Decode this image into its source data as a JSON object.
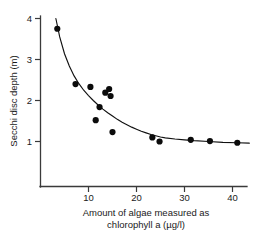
{
  "chart_data": {
    "type": "scatter",
    "title": "",
    "subtitle": "",
    "xlabel": "Amount of algae measured as chlorophyll a (µg/l)",
    "xlabel_line1": "Amount of algae measured as",
    "xlabel_line2": "chlorophyll a (µg/l)",
    "ylabel": "Secchi disc depth (m)",
    "xlim": [
      0,
      44
    ],
    "ylim": [
      0,
      4.2
    ],
    "xticks": [
      10,
      20,
      30,
      40
    ],
    "xtick_labels": [
      "10",
      "20",
      "30",
      "40"
    ],
    "yticks": [
      1,
      2,
      3,
      4
    ],
    "ytick_labels": [
      "1",
      "2",
      "3",
      "4"
    ],
    "grid": false,
    "legend": false,
    "legend_position": "none",
    "marker": "filled-circle",
    "marker_color": "#0b0b0b",
    "curve_color": "#111111",
    "axis_color": "#3a3a3a",
    "background_color": "#ffffff",
    "x": [
      3.5,
      7.3,
      10.4,
      11.5,
      12.3,
      13.5,
      14.3,
      14.6,
      15.0,
      23.3,
      24.8,
      31.3,
      35.3,
      41.0
    ],
    "y": [
      3.75,
      2.4,
      2.33,
      1.52,
      1.84,
      2.19,
      2.28,
      2.11,
      1.23,
      1.1,
      1.0,
      1.04,
      1.01,
      0.97
    ],
    "points": [
      {
        "x": 3.5,
        "y": 3.75
      },
      {
        "x": 7.3,
        "y": 2.4
      },
      {
        "x": 10.4,
        "y": 2.33
      },
      {
        "x": 11.5,
        "y": 1.52
      },
      {
        "x": 12.3,
        "y": 1.84
      },
      {
        "x": 13.5,
        "y": 2.19
      },
      {
        "x": 14.3,
        "y": 2.28
      },
      {
        "x": 14.6,
        "y": 2.11
      },
      {
        "x": 15.0,
        "y": 1.23
      },
      {
        "x": 23.3,
        "y": 1.1
      },
      {
        "x": 24.8,
        "y": 1.0
      },
      {
        "x": 31.3,
        "y": 1.04
      },
      {
        "x": 35.3,
        "y": 1.01
      },
      {
        "x": 41.0,
        "y": 0.97
      }
    ],
    "fit_curve": {
      "description": "decaying curve approaching asymptote near 0.95 m",
      "x": [
        3.2,
        4.0,
        5.0,
        6.0,
        7.0,
        8.0,
        9.0,
        10.0,
        11.0,
        12.0,
        13.0,
        14.0,
        15.0,
        16.0,
        17.0,
        18.0,
        19.0,
        20.0,
        21.0,
        22.0,
        23.0,
        24.0,
        25.0,
        26.0,
        28.0,
        30.0,
        32.0,
        35.0,
        38.0,
        41.0,
        43.5
      ],
      "y": [
        4.0,
        3.55,
        3.14,
        2.84,
        2.6,
        2.41,
        2.25,
        2.12,
        2.0,
        1.89,
        1.79,
        1.7,
        1.62,
        1.54,
        1.47,
        1.41,
        1.35,
        1.3,
        1.25,
        1.21,
        1.17,
        1.14,
        1.11,
        1.09,
        1.06,
        1.04,
        1.02,
        1.0,
        0.98,
        0.97,
        0.96
      ]
    }
  }
}
